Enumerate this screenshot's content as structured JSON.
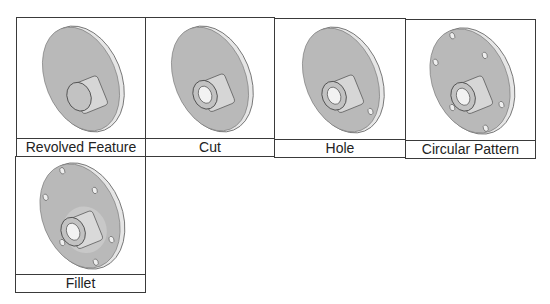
{
  "figure": {
    "panels": [
      {
        "label": "Revolved Feature",
        "step": "revolved",
        "holes": 0,
        "bore": false,
        "fillet": false
      },
      {
        "label": "Cut",
        "step": "cut",
        "holes": 0,
        "bore": true,
        "fillet": false
      },
      {
        "label": "Hole",
        "step": "hole",
        "holes": 1,
        "bore": true,
        "fillet": false
      },
      {
        "label": "Circular Pattern",
        "step": "pattern",
        "holes": 6,
        "bore": true,
        "fillet": false
      },
      {
        "label": "Fillet",
        "step": "fillet",
        "holes": 6,
        "bore": true,
        "fillet": true
      }
    ],
    "colors": {
      "disk": "#b9b9b9",
      "rim": "#e8e8e8",
      "edge": "#555555",
      "border": "#3a3a3a"
    }
  }
}
